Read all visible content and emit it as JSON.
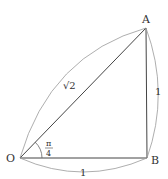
{
  "diagram": {
    "points": {
      "O": "O",
      "A": "A",
      "B": "B"
    },
    "edge_labels": {
      "OA": "√2",
      "AB": "1",
      "OB": "1"
    },
    "angle": {
      "numerator": "π",
      "denominator": "4"
    }
  }
}
